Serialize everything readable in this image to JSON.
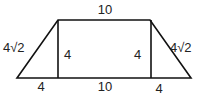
{
  "diagram": {
    "shape": "isosceles trapezoid with two altitudes",
    "colors": {
      "stroke": "#111111",
      "text": "#222222",
      "background": "#ffffff"
    },
    "labels": {
      "top_base": "10",
      "bottom_left_segment": "4",
      "bottom_middle_segment": "10",
      "bottom_right_segment": "4",
      "left_leg": "4√2",
      "right_leg": "4√2",
      "left_height": "4",
      "right_height": "4"
    }
  }
}
